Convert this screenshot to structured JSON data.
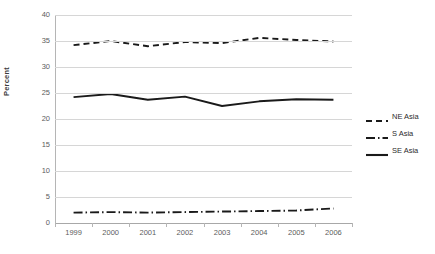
{
  "chart_data": {
    "type": "line",
    "title": "",
    "xlabel": "",
    "ylabel": "Percent",
    "categories": [
      "1999",
      "2000",
      "2001",
      "2002",
      "2003",
      "2004",
      "2005",
      "2006"
    ],
    "x": [
      1999,
      2000,
      2001,
      2002,
      2003,
      2004,
      2005,
      2006
    ],
    "ylim": [
      0,
      40
    ],
    "yticks": [
      0,
      5,
      10,
      15,
      20,
      25,
      30,
      35,
      40
    ],
    "ytick_labels": [
      "0",
      "5",
      "10",
      "15",
      "20",
      "25",
      "30",
      "35",
      "40"
    ],
    "grid": true,
    "legend_position": "right",
    "series": [
      {
        "name": "NE Asia",
        "style": "dashed",
        "color": "#1a1a1a",
        "values": [
          34.2,
          35.0,
          34.0,
          34.8,
          34.6,
          35.6,
          35.2,
          34.9
        ]
      },
      {
        "name": "S Asia",
        "style": "dash-dot",
        "color": "#1a1a1a",
        "values": [
          2.0,
          2.1,
          2.0,
          2.1,
          2.2,
          2.3,
          2.4,
          2.8
        ]
      },
      {
        "name": "SE Asia",
        "style": "solid",
        "color": "#1a1a1a",
        "values": [
          24.2,
          24.8,
          23.7,
          24.3,
          22.5,
          23.4,
          23.8,
          23.7
        ]
      }
    ]
  },
  "axes": {
    "y_title": "Percent"
  },
  "legend": {
    "entries": [
      {
        "label": "NE Asia",
        "swatch": "dashed-line-swatch"
      },
      {
        "label": "S Asia",
        "swatch": "dash-dot-line-swatch"
      },
      {
        "label": "SE Asia",
        "swatch": "solid-line-swatch"
      }
    ]
  },
  "colors": {
    "series_line": "#1a1a1a",
    "gridline": "#d6d6d6",
    "axis": "#b5b5b5",
    "tick_text": "#5c5c5c",
    "background": "#ffffff"
  }
}
